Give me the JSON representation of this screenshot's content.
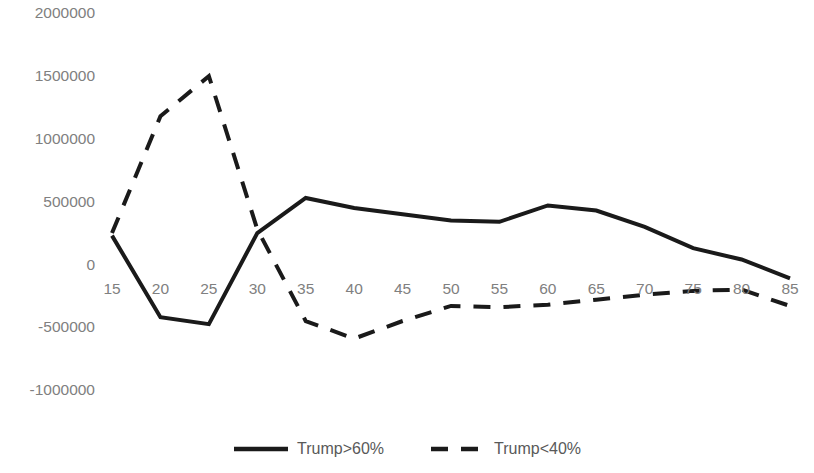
{
  "chart_data": {
    "type": "line",
    "title": "",
    "subtitle": "",
    "xlabel": "",
    "ylabel": "",
    "grid": false,
    "legend_position": "bottom",
    "x": [
      15,
      20,
      25,
      30,
      35,
      40,
      45,
      50,
      55,
      60,
      65,
      70,
      75,
      80,
      85
    ],
    "xtick_labels": [
      "15",
      "20",
      "25",
      "30",
      "35",
      "40",
      "45",
      "50",
      "55",
      "60",
      "65",
      "70",
      "75",
      "80",
      "85"
    ],
    "ytick_labels": [
      "2000000",
      "1500000",
      "1000000",
      "500000",
      "0",
      "-500000",
      "-1000000"
    ],
    "yticks": [
      2000000,
      1500000,
      1000000,
      500000,
      0,
      -500000,
      -1000000
    ],
    "ylim": [
      -1000000,
      2000000
    ],
    "xlim": [
      15,
      85
    ],
    "series": [
      {
        "name": "Trump>60%",
        "style": "solid",
        "color": "#1a1a1a",
        "values": [
          230000,
          -420000,
          -475000,
          250000,
          530000,
          450000,
          400000,
          350000,
          340000,
          470000,
          430000,
          300000,
          130000,
          40000,
          -110000
        ]
      },
      {
        "name": "Trump<40%",
        "style": "dashed",
        "color": "#1a1a1a",
        "values": [
          250000,
          1180000,
          1500000,
          280000,
          -450000,
          -590000,
          -450000,
          -330000,
          -340000,
          -320000,
          -280000,
          -240000,
          -210000,
          -200000,
          -330000
        ]
      }
    ]
  },
  "legend": {
    "items": [
      {
        "label": "Trump>60%",
        "style": "solid"
      },
      {
        "label": "Trump<40%",
        "style": "dashed"
      }
    ]
  }
}
